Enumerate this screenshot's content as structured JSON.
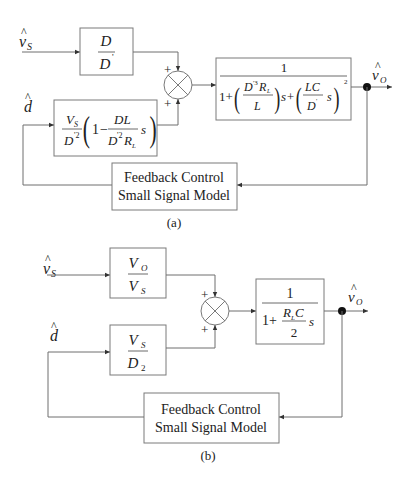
{
  "diagram_a": {
    "caption": "(a)",
    "inputs": {
      "vs": {
        "hat": "^",
        "symbol": "v",
        "sub": "S"
      },
      "d": {
        "hat": "^",
        "symbol": "d"
      }
    },
    "output": {
      "hat": "^",
      "symbol": "v",
      "sub": "O"
    },
    "block_vs": {
      "num": "D",
      "den": "D",
      "den_prime": "'"
    },
    "block_d": {
      "coef_num": "V",
      "coef_num_sub": "S",
      "coef_den": "D",
      "coef_den_sup": "'2",
      "one": "1",
      "minus": "−",
      "inner_num": "DL",
      "inner_den": "D",
      "inner_den_sup": "'2",
      "inner_den_tail": "R",
      "inner_den_sub": "L",
      "s": "s"
    },
    "summing_junction": {
      "top_sign": "+",
      "bottom_sign": "+"
    },
    "block_plant": {
      "num": "1",
      "den_one": "1+",
      "t1_num": "D",
      "t1_num_sup": "'3",
      "t1_num_tail": "R",
      "t1_num_sub": "L",
      "t1_den": "L",
      "s_plus": "s+",
      "t2_num": "LC",
      "t2_den": "D",
      "t2_den_sup": "'",
      "t2_s": "s",
      "exp": "2"
    },
    "feedback_block": {
      "line1": "Feedback Control",
      "line2": "Small Signal Model"
    }
  },
  "diagram_b": {
    "caption": "(b)",
    "inputs": {
      "vs": {
        "hat": "^",
        "symbol": "v",
        "sub": "S"
      },
      "d": {
        "hat": "^",
        "symbol": "d"
      }
    },
    "output": {
      "hat": "^",
      "symbol": "v",
      "sub": "O"
    },
    "block_vs": {
      "num": "V",
      "num_sub": "O",
      "den": "V",
      "den_sub": "S"
    },
    "block_d": {
      "num": "V",
      "num_sub": "S",
      "den": "D",
      "den_sub": "2"
    },
    "summing_junction": {
      "top_sign": "+",
      "bottom_sign": "+"
    },
    "block_plant": {
      "num": "1",
      "den_one": "1+",
      "frac_num": "R",
      "frac_num_sub": "L",
      "frac_num_tail": "C",
      "frac_den": "2",
      "s": "s"
    },
    "feedback_block": {
      "line1": "Feedback Control",
      "line2": "Small Signal Model"
    }
  }
}
